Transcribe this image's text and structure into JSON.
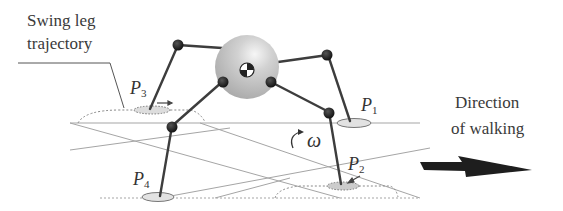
{
  "labels": {
    "swing_line1": "Swing leg",
    "swing_line2": "trajectory",
    "direction_line1": "Direction",
    "direction_line2": "of walking",
    "omega": "ω"
  },
  "points": [
    {
      "id": "P1",
      "base": "P",
      "sub": "1"
    },
    {
      "id": "P2",
      "base": "P",
      "sub": "2"
    },
    {
      "id": "P3",
      "base": "P",
      "sub": "3"
    },
    {
      "id": "P4",
      "base": "P",
      "sub": "4"
    }
  ],
  "colors": {
    "leg": "#3d3d3d",
    "joint": "#1a1a1a",
    "body": "#c8c8c8",
    "ground_line": "#9a9a9a",
    "arrow": "#1e1e1e",
    "text": "#3a3a3a"
  }
}
